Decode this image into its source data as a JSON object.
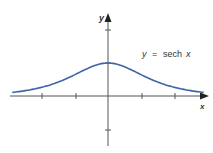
{
  "chart_data": {
    "type": "line",
    "title": "",
    "xlabel": "x",
    "ylabel": "y",
    "annotation": "y = sech x",
    "series": [
      {
        "name": "y = sech x",
        "function": "sech(x)",
        "color": "#3a63a8",
        "x": [
          -3,
          -2.5,
          -2,
          -1.5,
          -1,
          -0.5,
          0,
          0.5,
          1,
          1.5,
          2,
          2.5,
          3
        ],
        "values": [
          0.099,
          0.163,
          0.266,
          0.425,
          0.648,
          0.887,
          1.0,
          0.887,
          0.648,
          0.425,
          0.266,
          0.163,
          0.099
        ]
      }
    ],
    "xlim": [
      -3.1,
      3.1
    ],
    "ylim": [
      -1.6,
      2.3
    ],
    "x_ticks": [
      -2,
      -1,
      1,
      2
    ],
    "y_ticks": [
      -1,
      1,
      2
    ],
    "grid": false,
    "legend": "none"
  },
  "labels": {
    "x_axis": "x",
    "y_axis": "y",
    "eq_y": "y",
    "eq_eq": "=",
    "eq_fn": "sech",
    "eq_x": "x"
  },
  "colors": {
    "curve": "#3a63a8",
    "axis": "#555555"
  }
}
